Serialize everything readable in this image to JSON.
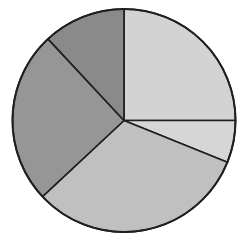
{
  "chart_data": {
    "type": "pie",
    "title": "",
    "subtitle": "",
    "xlabel": "",
    "ylabel": "",
    "grid": false,
    "legend": "none",
    "labels_visible": false,
    "start_angle_deg": 0,
    "direction": "clockwise",
    "center": {
      "x": 124,
      "y": 120.5
    },
    "radius": 111.5,
    "background_color": "#ffffff",
    "edge_color": "#231f20",
    "edge_width": 1.8,
    "categories": [
      "Slice 1",
      "Slice 2",
      "Slice 3",
      "Slice 4",
      "Slice 5"
    ],
    "values": [
      25.0,
      6.1,
      31.9,
      25.0,
      12.0
    ],
    "angles_deg": [
      90.0,
      22.0,
      115.0,
      90.0,
      43.0
    ],
    "boundaries_deg": [
      0,
      90,
      112,
      227,
      317,
      360
    ],
    "colors": [
      "#d3d3d3",
      "#d6d6d6",
      "#c0c0c0",
      "#969696",
      "#8a8a8a"
    ],
    "slices": [
      {
        "name": "Slice 1",
        "value": 25.0,
        "angle_deg": 90.0,
        "start_deg": 0,
        "end_deg": 90,
        "color": "#d3d3d3",
        "position": "top-right"
      },
      {
        "name": "Slice 2",
        "value": 6.1,
        "angle_deg": 22.0,
        "start_deg": 90,
        "end_deg": 112,
        "color": "#d6d6d6",
        "position": "right"
      },
      {
        "name": "Slice 3",
        "value": 31.9,
        "angle_deg": 115.0,
        "start_deg": 112,
        "end_deg": 227,
        "color": "#c0c0c0",
        "position": "bottom"
      },
      {
        "name": "Slice 4",
        "value": 25.0,
        "angle_deg": 90.0,
        "start_deg": 227,
        "end_deg": 317,
        "color": "#969696",
        "position": "left"
      },
      {
        "name": "Slice 5",
        "value": 12.0,
        "angle_deg": 43.0,
        "start_deg": 317,
        "end_deg": 360,
        "color": "#8a8a8a",
        "position": "top-left"
      }
    ]
  }
}
